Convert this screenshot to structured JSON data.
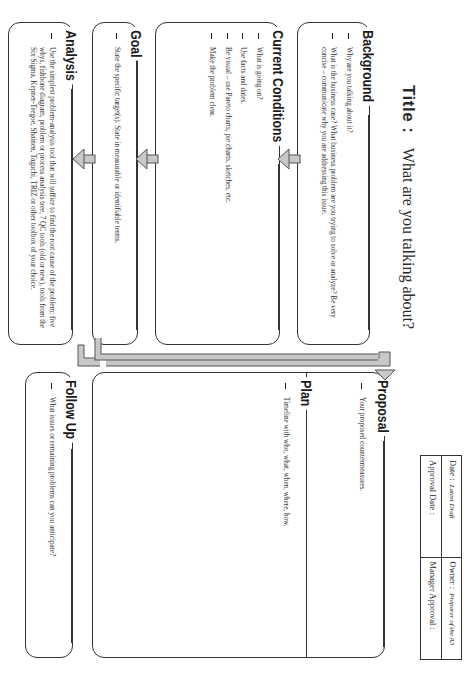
{
  "title": {
    "label": "Title :",
    "text": "What are you talking about?"
  },
  "header_table": {
    "date_label": "Date :",
    "date_value": "Latest Draft",
    "owner_label": "Owner :",
    "owner_value": "Preparer of the A3",
    "approval_date_label": "Approval Date :",
    "manager_approval_label": "Manager Approval :"
  },
  "sections": {
    "background": {
      "heading": "Background",
      "items": [
        "Why are you talking about it?",
        "What is the business case? What business problem are you trying to solve or analyze? Be very concise – communicate why you are addressing this issue."
      ]
    },
    "current_conditions": {
      "heading": "Current Conditions",
      "items": [
        "What is going on?",
        "Use facts and dates.",
        "Be visual – use Pareto charts, pie charts, sketches, etc.",
        "Make the problem clear."
      ]
    },
    "goal": {
      "heading": "Goal",
      "items": [
        "State the specific target(s). State in measurable or identifiable terms."
      ]
    },
    "analysis": {
      "heading": "Analysis",
      "items": [
        "Use the simplest problem-analysis tool that will suffice to find the root cause of the problem: five whys, fishbone diagram, problem or process analysis tree, 7 QC tools (old or new), tools from the Six Sigma, Kepner-Tregoe, Shainen, Taguchi, TRIZ or other toolbox of your choice."
      ]
    },
    "proposal": {
      "heading": "Proposal",
      "items": [
        "Your proposed countermeasures."
      ]
    },
    "plan": {
      "heading": "Plan",
      "items": [
        "Timeline with who, what, when, where, how."
      ]
    },
    "follow_up": {
      "heading": "Follow Up",
      "items": [
        "What issues or remaining problems can you anticipate?"
      ]
    }
  },
  "colors": {
    "line": "#333333",
    "arrow_fill": "#c8c8c8",
    "arrow_stroke": "#555555",
    "background": "#ffffff"
  }
}
